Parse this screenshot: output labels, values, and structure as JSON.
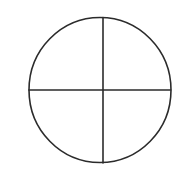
{
  "canvas": {
    "width": 190,
    "height": 175,
    "background": "#ffffff"
  },
  "diagram": {
    "stroke_color": "#2b2b2b",
    "stroke_width": 1.6,
    "circle": {
      "cx": 100,
      "cy": 90,
      "rx": 71,
      "ry": 72.5
    },
    "horizontal_line": {
      "x1": 29,
      "y1": 90,
      "x2": 170.5,
      "y2": 90
    },
    "vertical_line": {
      "x1": 103,
      "y1": 17.5,
      "x2": 103,
      "y2": 163
    }
  }
}
